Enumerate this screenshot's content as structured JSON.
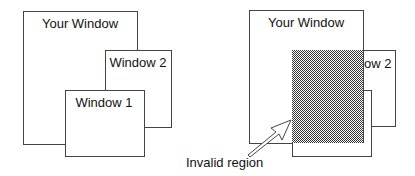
{
  "left_diagram": {
    "your_window": "Your Window",
    "window_2": "Window 2",
    "window_1": "Window 1"
  },
  "right_diagram": {
    "your_window": "Your Window",
    "window_2_partial": "ow 2",
    "invalid_region_label": "Invalid region"
  },
  "colors": {
    "outline": "#444444",
    "hatch_dark": "#333333",
    "hatch_light": "#ffffff"
  }
}
